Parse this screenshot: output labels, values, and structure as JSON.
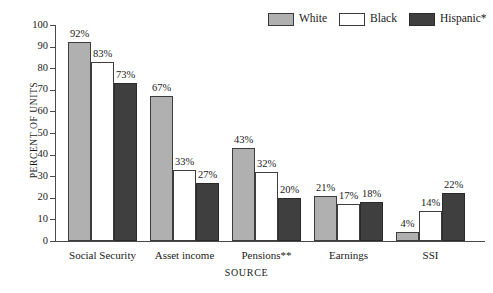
{
  "chart_data": {
    "type": "bar",
    "title": "",
    "subtitle": "",
    "xlabel": "SOURCE",
    "ylabel": "PERCENT OF UNITS",
    "ylim": [
      0,
      100
    ],
    "ytick_step": 10,
    "yticks": [
      100,
      90,
      80,
      70,
      60,
      50,
      40,
      30,
      20,
      10,
      0
    ],
    "grid": false,
    "legend_position": "top-right",
    "value_label_suffix": "%",
    "categories": [
      "Social Security",
      "Asset income",
      "Pensions**",
      "Earnings",
      "SSI"
    ],
    "series": [
      {
        "name": "White",
        "color": "#b0b0b0",
        "border": "#3d3d3d",
        "values": [
          92,
          67,
          43,
          21,
          4
        ],
        "labels": [
          "92%",
          "67%",
          "43%",
          "21%",
          "4%"
        ]
      },
      {
        "name": "Black",
        "color": "#ffffff",
        "border": "#3d3d3d",
        "values": [
          83,
          33,
          32,
          17,
          14
        ],
        "labels": [
          "83%",
          "33%",
          "32%",
          "17%",
          "14%"
        ]
      },
      {
        "name": "Hispanic*",
        "color": "#3f3f3f",
        "border": "#2a2a2a",
        "values": [
          73,
          27,
          20,
          18,
          22
        ],
        "labels": [
          "73%",
          "27%",
          "20%",
          "18%",
          "22%"
        ]
      }
    ]
  },
  "legend": {
    "items": [
      {
        "label": "White"
      },
      {
        "label": "Black"
      },
      {
        "label": "Hispanic*"
      }
    ]
  },
  "axes": {
    "y_title": "PERCENT OF UNITS",
    "x_title": "SOURCE",
    "y_tick_labels": [
      "100",
      "90",
      "80",
      "70",
      "60",
      "50",
      "40",
      "30",
      "20",
      "10",
      "0"
    ],
    "x_tick_labels": [
      "Social Security",
      "Asset income",
      "Pensions**",
      "Earnings",
      "SSI"
    ]
  }
}
